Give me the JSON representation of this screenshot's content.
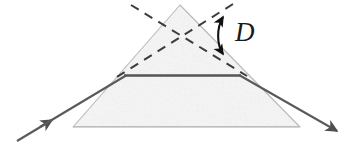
{
  "figure": {
    "type": "optics-ray-diagram",
    "background_color": "#ffffff",
    "width": 356,
    "height": 155
  },
  "prism": {
    "name": "triangular prism",
    "apex": [
      180,
      5
    ],
    "base_left": [
      73,
      127
    ],
    "base_right": [
      300,
      127
    ],
    "fill_color": "#f7f7f7",
    "stroke_color": "#b9b9b9",
    "stroke_width": 1.1,
    "texture": "faint mottled gray paper grain"
  },
  "rays": {
    "stroke_color": "#5a5a5a",
    "incident": {
      "label": "incident ray",
      "from": [
        17,
        141
      ],
      "to": [
        125,
        75
      ],
      "arrow_at": [
        50,
        121
      ],
      "stroke_width": 2.1
    },
    "internal": {
      "label": "refracted ray inside prism",
      "from": [
        125,
        75
      ],
      "to": [
        240,
        75
      ],
      "stroke_width": 2.4,
      "stroke_color": "#555555"
    },
    "emergent": {
      "label": "emergent ray",
      "from": [
        240,
        75
      ],
      "to": [
        338,
        132
      ],
      "arrow_at": [
        338,
        132
      ],
      "stroke_width": 2.1
    }
  },
  "construction_lines": {
    "label": "dashed ray extensions",
    "stroke_color": "#3c3c3c",
    "stroke_width": 2.0,
    "dash_pattern": "9 7",
    "incident_extension": {
      "label": "extension of incident ray",
      "from": [
        131,
        5
      ],
      "to": [
        247,
        76
      ]
    },
    "emergent_extension": {
      "label": "backward extension of emergent ray",
      "from": [
        233,
        4
      ],
      "to": [
        112,
        80
      ]
    }
  },
  "angle_marker": {
    "name": "deviation angle",
    "label": "D",
    "arc_from": [
      222,
      14
    ],
    "arc_to": [
      222,
      57
    ],
    "arc_bulge": 8,
    "double_headed": true,
    "color": "#111111",
    "label_position": [
      236,
      20
    ],
    "label_font_size": 27
  }
}
